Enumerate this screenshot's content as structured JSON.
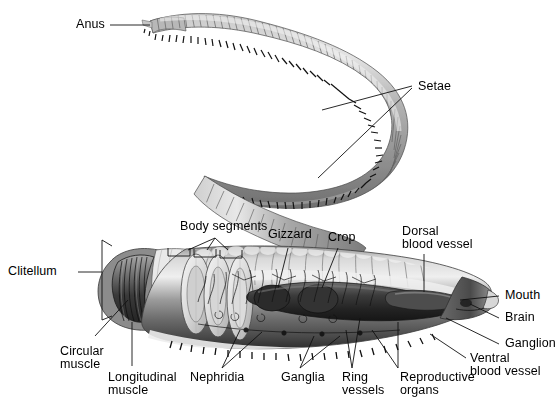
{
  "figure": {
    "background_color": "#ffffff",
    "body_color": "#9a9a9a",
    "line_color": "#1a1a1a"
  },
  "labels": {
    "anus": "Anus",
    "setae": "Setae",
    "body_segments": "Body segments",
    "gizzard": "Gizzard",
    "crop": "Crop",
    "dorsal_blood_vessel_l1": "Dorsal",
    "dorsal_blood_vessel_l2": "blood vessel",
    "clitellum": "Clitellum",
    "mouth": "Mouth",
    "brain": "Brain",
    "ganglion": "Ganglion",
    "ventral_blood_vessel_l1": "Ventral",
    "ventral_blood_vessel_l2": "blood vessel",
    "circular_muscle_l1": "Circular",
    "circular_muscle_l2": "muscle",
    "longitudinal_muscle_l1": "Longitudinal",
    "longitudinal_muscle_l2": "muscle",
    "nephridia": "Nephridia",
    "ganglia": "Ganglia",
    "ring_vessels_l1": "Ring",
    "ring_vessels_l2": "vessels",
    "reproductive_organs_l1": "Reproductive",
    "reproductive_organs_l2": "organs"
  }
}
